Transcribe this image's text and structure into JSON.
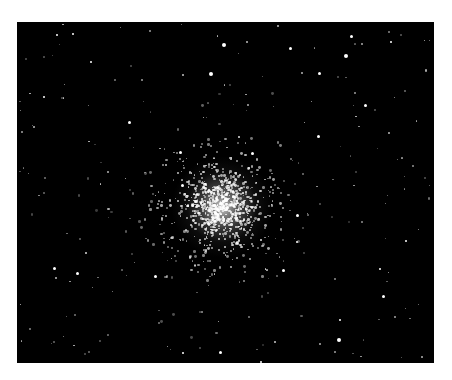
{
  "image": {
    "subject": "Globular star cluster",
    "description": "Dense star cluster on black sky background"
  },
  "colors": {
    "sky": "#000000",
    "star": "#ffffff",
    "border": "#ffffff"
  },
  "bright_stars": [
    [
      224,
      45,
      4
    ],
    [
      351,
      36,
      3
    ],
    [
      346,
      56,
      4
    ],
    [
      211,
      74,
      4
    ],
    [
      290,
      48,
      3
    ],
    [
      391,
      42,
      2
    ],
    [
      319,
      73,
      3
    ],
    [
      365,
      105,
      3
    ],
    [
      44,
      97,
      2
    ],
    [
      57,
      35,
      2
    ],
    [
      73,
      34,
      2
    ],
    [
      91,
      62,
      2
    ],
    [
      129,
      122,
      3
    ],
    [
      318,
      136,
      3
    ],
    [
      180,
      152,
      3
    ],
    [
      252,
      153,
      3
    ],
    [
      182,
      185,
      3
    ],
    [
      54,
      268,
      3
    ],
    [
      77,
      273,
      3
    ],
    [
      155,
      276,
      3
    ],
    [
      283,
      270,
      3
    ],
    [
      383,
      296,
      3
    ],
    [
      339,
      340,
      4
    ],
    [
      340,
      320,
      2
    ],
    [
      220,
      352,
      3
    ],
    [
      261,
      362,
      2
    ],
    [
      183,
      353,
      2
    ],
    [
      406,
      241,
      2
    ],
    [
      380,
      269,
      2
    ],
    [
      297,
      215,
      3
    ],
    [
      297,
      242,
      2
    ]
  ]
}
